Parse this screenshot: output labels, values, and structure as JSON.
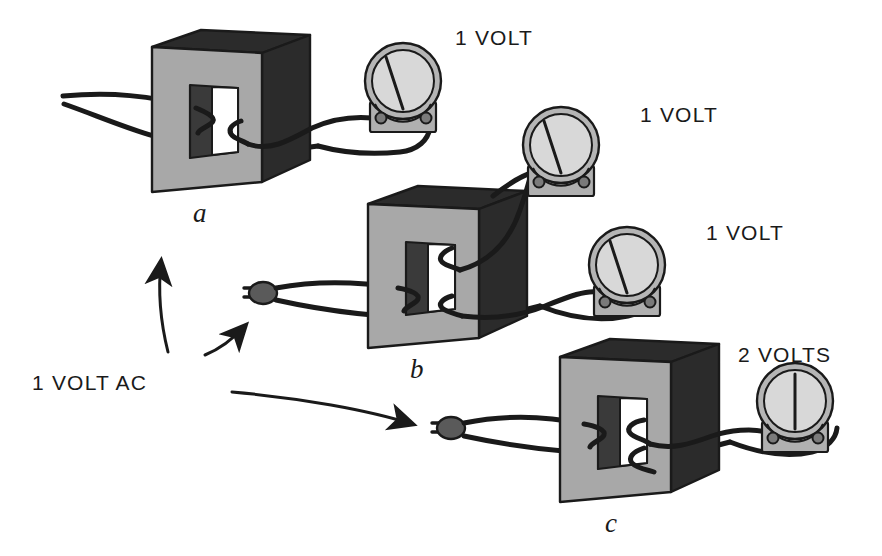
{
  "figure": {
    "type": "physics-illustration",
    "background_color": "#ffffff",
    "ink_color": "#1a1a1a"
  },
  "palette": {
    "core_front": "#a8a8a8",
    "core_top_dark": "#2b2b2b",
    "core_side_dark": "#2b2b2b",
    "window_wall": "#3a3a3a",
    "window_hole": "#ffffff",
    "meter_ring": "#b5b5b5",
    "meter_face": "#d8d8d8",
    "meter_base": "#b0b0b0",
    "plug_body": "#5a5a5a",
    "wire": "#1a1a1a",
    "outline": "#1a1a1a"
  },
  "source": {
    "label": "1 VOLT AC",
    "arrow_count": 3,
    "arrow_targets": [
      "a",
      "b",
      "c"
    ]
  },
  "transformers": [
    {
      "id": "a",
      "label": "a",
      "primary_turns": 1,
      "secondary_turns": 1,
      "meter_count": 1,
      "readings": [
        "1 VOLT"
      ]
    },
    {
      "id": "b",
      "label": "b",
      "primary_turns": 1,
      "secondary_turns": 1,
      "meter_count": 2,
      "readings": [
        "1 VOLT",
        "1 VOLT"
      ]
    },
    {
      "id": "c",
      "label": "c",
      "primary_turns": 1,
      "secondary_turns": 2,
      "meter_count": 1,
      "readings": [
        "2 VOLTS"
      ]
    }
  ],
  "meters": [
    {
      "id": "meter-a1",
      "reading": "1 VOLT",
      "needle_angle_deg": -32,
      "terminals": 2
    },
    {
      "id": "meter-b1",
      "reading": "1 VOLT",
      "needle_angle_deg": -32,
      "terminals": 2
    },
    {
      "id": "meter-b2",
      "reading": "1 VOLT",
      "needle_angle_deg": -32,
      "terminals": 2
    },
    {
      "id": "meter-c1",
      "reading": "2 VOLTS",
      "needle_angle_deg": 0,
      "terminals": 2
    }
  ],
  "labels": {
    "volt_a": "1 VOLT",
    "volt_b1": "1 VOLT",
    "volt_b2": "1 VOLT",
    "volt_c": "2 VOLTS",
    "source": "1 VOLT AC",
    "core_a": "a",
    "core_b": "b",
    "core_c": "c"
  }
}
